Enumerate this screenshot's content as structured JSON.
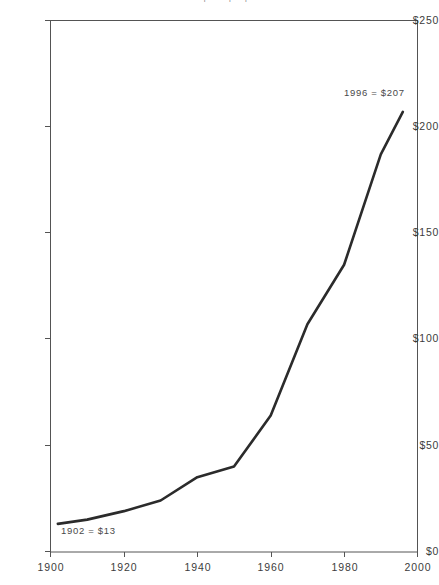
{
  "chart_data": {
    "type": "line",
    "title": "Food Cost per Capita per Year",
    "subtitle": "",
    "xlabel": "",
    "ylabel": "",
    "xlim": [
      1900,
      2000
    ],
    "ylim": [
      0,
      250
    ],
    "grid": false,
    "legend": false,
    "legend_position": "none",
    "x_ticks": [
      1900,
      1920,
      1940,
      1960,
      1980,
      2000
    ],
    "x_tick_labels": [
      "1900",
      "1920",
      "1940",
      "1960",
      "1980",
      "2000"
    ],
    "y_ticks": [
      0,
      50,
      100,
      150,
      200,
      250
    ],
    "y_tick_labels": [
      "$0",
      "$50",
      "$100",
      "$150",
      "$200",
      "$250"
    ],
    "line_color": "#2b2b2b",
    "line_width": 2.6,
    "x": [
      1902,
      1910,
      1920,
      1930,
      1940,
      1950,
      1960,
      1970,
      1980,
      1990,
      1996
    ],
    "values": [
      13,
      15,
      19,
      24,
      35,
      40,
      64,
      107,
      135,
      187,
      207
    ],
    "series": [
      {
        "name": "Food cost per capita",
        "x": [
          1902,
          1910,
          1920,
          1930,
          1940,
          1950,
          1960,
          1970,
          1980,
          1990,
          1996
        ],
        "values": [
          13,
          15,
          19,
          24,
          35,
          40,
          64,
          107,
          135,
          187,
          207
        ]
      }
    ],
    "annotations": [
      {
        "id": "start",
        "text": "1902 = $13",
        "x": 1902,
        "y": 13
      },
      {
        "id": "end",
        "text": "1996 = $207",
        "x": 1996,
        "y": 207
      }
    ]
  },
  "axis": {
    "frame_color": "#545454",
    "tick_color": "#545454"
  }
}
